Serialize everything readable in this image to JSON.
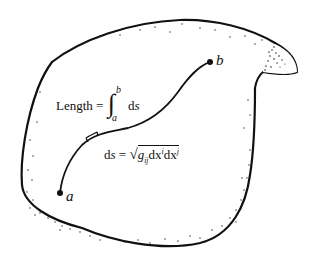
{
  "figure": {
    "colors": {
      "ink": "#111111",
      "background": "#ffffff"
    },
    "points": [
      {
        "name": "a",
        "label": "a"
      },
      {
        "name": "b",
        "label": "b"
      }
    ],
    "length_formula": {
      "lhs": "Length =",
      "integral_sign": "∫",
      "upper_limit": "b",
      "lower_limit": "a",
      "integrand_d": "d",
      "integrand_var": "s"
    },
    "line_element": {
      "lhs_d": "d",
      "lhs_var": "s",
      "equals": "=",
      "sqrt": "√",
      "g": "g",
      "g_sub": "ij",
      "d1": "dx",
      "sup1": "i",
      "d2": "dx",
      "sup2": "j"
    }
  }
}
